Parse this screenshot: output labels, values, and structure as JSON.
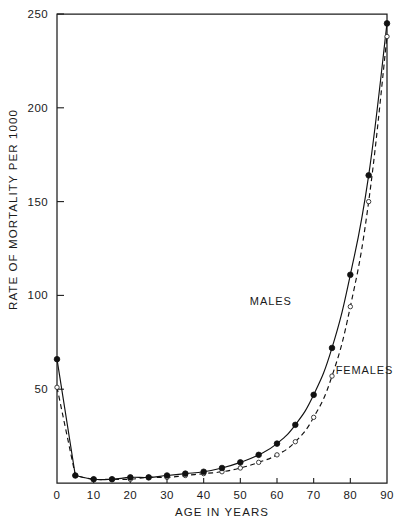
{
  "chart_data": {
    "type": "line",
    "title": "",
    "xlabel": "AGE IN YEARS",
    "ylabel": "RATE OF MORTALITY PER 1000",
    "xlim": [
      0,
      90
    ],
    "ylim": [
      0,
      250
    ],
    "xticks": [
      0,
      10,
      20,
      30,
      40,
      50,
      60,
      70,
      80,
      90
    ],
    "xtick_labels": [
      "0",
      "10",
      "20",
      "30",
      "40",
      "50",
      "60",
      "70",
      "80",
      "90"
    ],
    "yticks": [
      0,
      50,
      100,
      150,
      200,
      250
    ],
    "ytick_labels": [
      "0",
      "50",
      "100",
      "150",
      "200",
      "250"
    ],
    "grid": false,
    "legend_position": "inline-annotation",
    "x": [
      0,
      5,
      10,
      15,
      20,
      25,
      30,
      35,
      40,
      45,
      50,
      55,
      60,
      65,
      70,
      75,
      80,
      85,
      90
    ],
    "series": [
      {
        "name": "MALES",
        "style": "solid",
        "marker": "filled-circle",
        "values": [
          66,
          4,
          2,
          2,
          3,
          3,
          4,
          5,
          6,
          8,
          11,
          15,
          21,
          31,
          47,
          72,
          111,
          164,
          245
        ]
      },
      {
        "name": "FEMALES",
        "style": "dashed",
        "marker": "open-circle",
        "values": [
          51,
          4,
          2,
          2,
          2,
          3,
          3,
          4,
          5,
          6,
          8,
          11,
          15,
          22,
          35,
          57,
          94,
          150,
          238
        ]
      }
    ],
    "annotations": [
      {
        "text": "MALES",
        "x": 64,
        "y": 95
      },
      {
        "text": "FEMALES",
        "x": 76,
        "y": 58
      }
    ]
  },
  "axes": {
    "y_title": "RATE OF MORTALITY PER 1000",
    "x_title": "AGE IN YEARS"
  }
}
